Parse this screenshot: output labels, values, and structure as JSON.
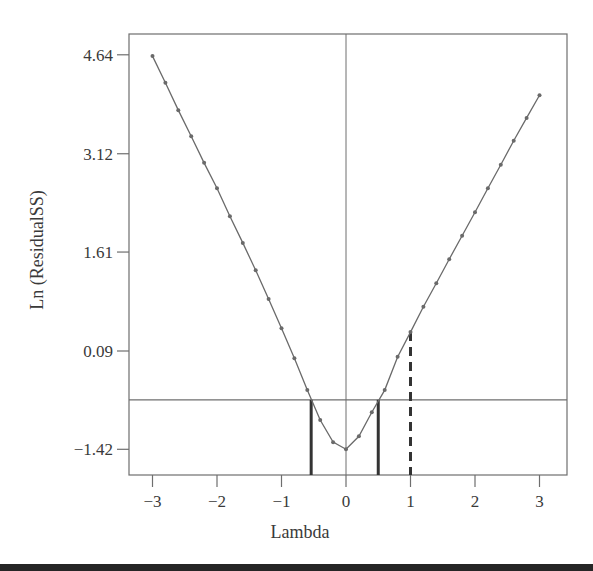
{
  "chart_data": {
    "type": "line",
    "title": "",
    "xlabel": "Lambda",
    "ylabel": "Ln (ResidualSS)",
    "xlim": [
      -3.3,
      3.4
    ],
    "ylim": [
      -1.82,
      5.0
    ],
    "x_ticks": [
      -3,
      -2,
      -1,
      0,
      1,
      2,
      3
    ],
    "x_tick_labels": [
      "−3",
      "−2",
      "−1",
      "0",
      "1",
      "2",
      "3"
    ],
    "y_ticks": [
      4.64,
      3.12,
      1.61,
      0.09,
      -1.42
    ],
    "y_tick_labels": [
      "4.64",
      "3.12",
      "1.61",
      "0.09",
      "−1.42"
    ],
    "grid": false,
    "legend": null,
    "series": [
      {
        "name": "Ln (ResidualSS)",
        "markers": true,
        "x": [
          -3.0,
          -2.8,
          -2.6,
          -2.4,
          -2.2,
          -2.0,
          -1.8,
          -1.6,
          -1.4,
          -1.2,
          -1.0,
          -0.8,
          -0.6,
          -0.4,
          -0.2,
          0.0,
          0.2,
          0.4,
          0.6,
          0.8,
          1.0,
          1.2,
          1.4,
          1.6,
          1.8,
          2.0,
          2.2,
          2.4,
          2.6,
          2.8,
          3.0
        ],
        "values": [
          4.62,
          4.21,
          3.79,
          3.39,
          2.98,
          2.59,
          2.16,
          1.75,
          1.33,
          0.89,
          0.44,
          -0.02,
          -0.51,
          -0.97,
          -1.31,
          -1.42,
          -1.22,
          -0.85,
          -0.51,
          0.0,
          0.38,
          0.77,
          1.13,
          1.5,
          1.86,
          2.22,
          2.59,
          2.95,
          3.32,
          3.67,
          4.02
        ]
      }
    ],
    "annotations": {
      "threshold_line": {
        "orientation": "horizontal",
        "y": -0.66
      },
      "zero_line": {
        "orientation": "vertical",
        "x": 0
      },
      "confidence_bounds": [
        {
          "style": "solid",
          "x": -0.54,
          "y_top": -0.66
        },
        {
          "style": "solid",
          "x": 0.5,
          "y_top": -0.66
        }
      ],
      "reference_line": {
        "style": "dashed",
        "x": 1.0,
        "y_top": 0.38
      }
    }
  },
  "colors": {
    "curve": "#6a6a6a",
    "axes": "#6e6e6e",
    "bounds": "#333333",
    "text": "#3a3a3a"
  }
}
